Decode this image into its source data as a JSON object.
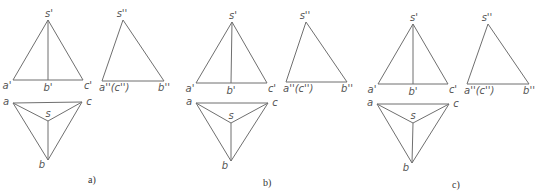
{
  "figure": {
    "panels": [
      {
        "caption": "a)",
        "front": {
          "s": {
            "label": "s'",
            "x": 48,
            "y": 20
          },
          "a": {
            "label": "a'",
            "x": 13,
            "y": 80
          },
          "b": {
            "label": "b'",
            "x": 48,
            "y": 80
          },
          "c": {
            "label": "c'",
            "x": 83,
            "y": 80
          }
        },
        "side": {
          "s": {
            "label": "s''",
            "x": 123,
            "y": 20
          },
          "ac": {
            "label": "a''(c'')",
            "x": 102,
            "y": 81
          },
          "b": {
            "label": "b''",
            "x": 164,
            "y": 81
          }
        },
        "top": {
          "a": {
            "label": "a",
            "x": 13,
            "y": 103
          },
          "c": {
            "label": "c",
            "x": 82,
            "y": 102
          },
          "s": {
            "label": "s",
            "x": 48,
            "y": 121
          },
          "b": {
            "label": "b",
            "x": 48,
            "y": 160
          }
        },
        "caption_pos": {
          "x": 88,
          "y": 183
        }
      },
      {
        "caption": "b)",
        "front": {
          "s": {
            "label": "s'",
            "x": 232,
            "y": 22
          },
          "a": {
            "label": "a'",
            "x": 196,
            "y": 83
          },
          "b": {
            "label": "b'",
            "x": 231,
            "y": 83
          },
          "c": {
            "label": "c'",
            "x": 267,
            "y": 83
          }
        },
        "side": {
          "s": {
            "label": "s''",
            "x": 306,
            "y": 22
          },
          "ac": {
            "label": "a''(c'')",
            "x": 286,
            "y": 82
          },
          "b": {
            "label": "b''",
            "x": 347,
            "y": 82
          }
        },
        "top": {
          "a": {
            "label": "a",
            "x": 196,
            "y": 103
          },
          "c": {
            "label": "c",
            "x": 268,
            "y": 103
          },
          "s": {
            "label": "s",
            "x": 231,
            "y": 123
          },
          "b": {
            "label": "b",
            "x": 231,
            "y": 161
          }
        },
        "caption_pos": {
          "x": 263,
          "y": 186
        }
      },
      {
        "caption": "c)",
        "front": {
          "s": {
            "label": "s'",
            "x": 413,
            "y": 24
          },
          "a": {
            "label": "a'",
            "x": 378,
            "y": 84
          },
          "b": {
            "label": "b'",
            "x": 413,
            "y": 84
          },
          "c": {
            "label": "c'",
            "x": 448,
            "y": 84
          }
        },
        "side": {
          "s": {
            "label": "s''",
            "x": 488,
            "y": 24
          },
          "ac": {
            "label": "a''(c'')",
            "x": 467,
            "y": 84
          },
          "b": {
            "label": "b''",
            "x": 529,
            "y": 84
          }
        },
        "top": {
          "a": {
            "label": "a",
            "x": 377,
            "y": 104
          },
          "c": {
            "label": "c",
            "x": 449,
            "y": 104
          },
          "s": {
            "label": "s",
            "x": 413,
            "y": 123
          },
          "b": {
            "label": "b",
            "x": 412,
            "y": 163
          }
        },
        "caption_pos": {
          "x": 452,
          "y": 188
        }
      }
    ]
  },
  "style": {
    "line_color": "#6f6f6f",
    "label_color": "#555555",
    "background": "#ffffff"
  }
}
